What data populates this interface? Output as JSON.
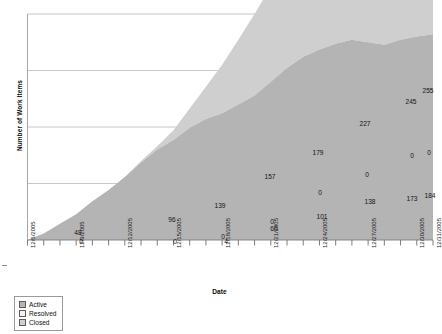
{
  "chart_data": {
    "type": "area",
    "title": "",
    "xlabel": "Date",
    "ylabel": "Number of Work Items",
    "stacked": true,
    "grid": true,
    "legend_position": "bottom-left",
    "ylim": [
      0,
      280
    ],
    "yticks": [
      0,
      70,
      140,
      210,
      280
    ],
    "x": [
      "12/6/2005",
      "12/7/2005",
      "12/8/2005",
      "12/9/2005",
      "12/10/2005",
      "12/11/2005",
      "12/12/2005",
      "12/13/2005",
      "12/14/2005",
      "12/15/2005",
      "12/16/2005",
      "12/17/2005",
      "12/18/2005",
      "12/19/2005",
      "12/20/2005",
      "12/21/2005",
      "12/22/2005",
      "12/23/2005",
      "12/24/2005",
      "12/25/2005",
      "12/26/2005",
      "12/27/2005",
      "12/28/2005",
      "12/29/2005",
      "12/30/2005",
      "12/31/2005"
    ],
    "xtick_labels": [
      "12/6/2005",
      "12/9/2005",
      "12/12/2005",
      "12/15/2005",
      "12/18/2005",
      "12/21/2005",
      "12/24/2005",
      "12/27/2005",
      "12/30/2005",
      "12/31/2005"
    ],
    "series": [
      {
        "name": "Active",
        "color": "#b4b4b4",
        "values": [
          0,
          8,
          20,
          32,
          48,
          62,
          78,
          96,
          112,
          124,
          139,
          150,
          157,
          168,
          179,
          196,
          213,
          227,
          236,
          243,
          248,
          245,
          242,
          248,
          252,
          255
        ]
      },
      {
        "name": "Resolved",
        "color": "#d8d8d8",
        "values": [
          0,
          0,
          0,
          0,
          0,
          0,
          0,
          0,
          0,
          0,
          0,
          0,
          0,
          0,
          0,
          0,
          0,
          0,
          0,
          0,
          0,
          0,
          0,
          0,
          0,
          0
        ]
      },
      {
        "name": "Closed",
        "color": "#cfcfcf",
        "values": [
          0,
          0,
          0,
          0,
          0,
          0,
          0,
          2,
          4,
          12,
          24,
          40,
          60,
          80,
          101,
          118,
          130,
          138,
          148,
          156,
          162,
          166,
          170,
          173,
          179,
          184
        ]
      }
    ],
    "point_labels": [
      {
        "text": "48",
        "x": 78,
        "y": 232
      },
      {
        "text": "0",
        "x": 81,
        "y": 241
      },
      {
        "text": "96",
        "x": 172,
        "y": 219
      },
      {
        "text": "0",
        "x": 175,
        "y": 241
      },
      {
        "text": "139",
        "x": 220,
        "y": 205
      },
      {
        "text": "0",
        "x": 223,
        "y": 236
      },
      {
        "text": "4",
        "x": 226,
        "y": 241
      },
      {
        "text": "157",
        "x": 270,
        "y": 176
      },
      {
        "text": "0",
        "x": 272,
        "y": 221
      },
      {
        "text": "60",
        "x": 274,
        "y": 228
      },
      {
        "text": "179",
        "x": 318,
        "y": 152
      },
      {
        "text": "0",
        "x": 320,
        "y": 192
      },
      {
        "text": "101",
        "x": 322,
        "y": 216
      },
      {
        "text": "227",
        "x": 365,
        "y": 123
      },
      {
        "text": "0",
        "x": 367,
        "y": 174
      },
      {
        "text": "138",
        "x": 370,
        "y": 201
      },
      {
        "text": "245",
        "x": 411,
        "y": 101
      },
      {
        "text": "0",
        "x": 412,
        "y": 155
      },
      {
        "text": "173",
        "x": 412,
        "y": 198
      },
      {
        "text": "255",
        "x": 428,
        "y": 90
      },
      {
        "text": "0",
        "x": 429,
        "y": 152
      },
      {
        "text": "184",
        "x": 430,
        "y": 195
      }
    ]
  },
  "legend": {
    "items": [
      {
        "label": "Active",
        "color": "#b4b4b4"
      },
      {
        "label": "Resolved",
        "color": "#f2f2f2"
      },
      {
        "label": "Closed",
        "color": "#cfcfcf"
      }
    ]
  },
  "axes": {
    "x_title": "Date",
    "y_title": "Number of Work Items"
  }
}
